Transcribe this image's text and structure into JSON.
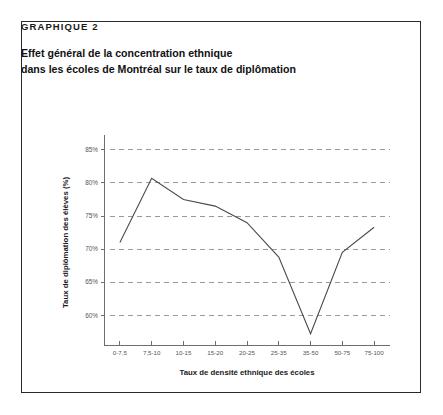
{
  "figure": {
    "label": "GRAPHIQUE 2",
    "title_line_1": "Effet général de la concentration ethnique",
    "title_line_2": "dans les écoles de Montréal sur le taux de diplômation",
    "border_color": "#2b2b2b"
  },
  "chart_data": {
    "type": "line",
    "title": "Effet général de la concentration ethnique dans les écoles de Montréal sur le taux de diplômation",
    "xlabel": "Taux de densité ethnique des écoles",
    "ylabel": "Taux de diplômation des élèves (%)",
    "categories": [
      "0-7,5",
      "7,5-10",
      "10-15",
      "15-20",
      "20-25",
      "25-35",
      "35-50",
      "50-75",
      "75-100"
    ],
    "values": [
      71.0,
      80.7,
      77.5,
      76.5,
      74.0,
      68.8,
      57.2,
      69.5,
      73.3
    ],
    "ylim": [
      55.5,
      86.5
    ],
    "ytick_values": [
      85,
      80,
      75,
      70,
      65,
      60
    ],
    "ytick_labels": [
      "85%",
      "80%",
      "75%",
      "70%",
      "65%",
      "60%"
    ],
    "grid": true,
    "grid_axis": "y",
    "legend": false,
    "line_color": "#4a4a4a",
    "grid_color": "#9a9a9a",
    "axis_color": "#6e6e6e"
  }
}
